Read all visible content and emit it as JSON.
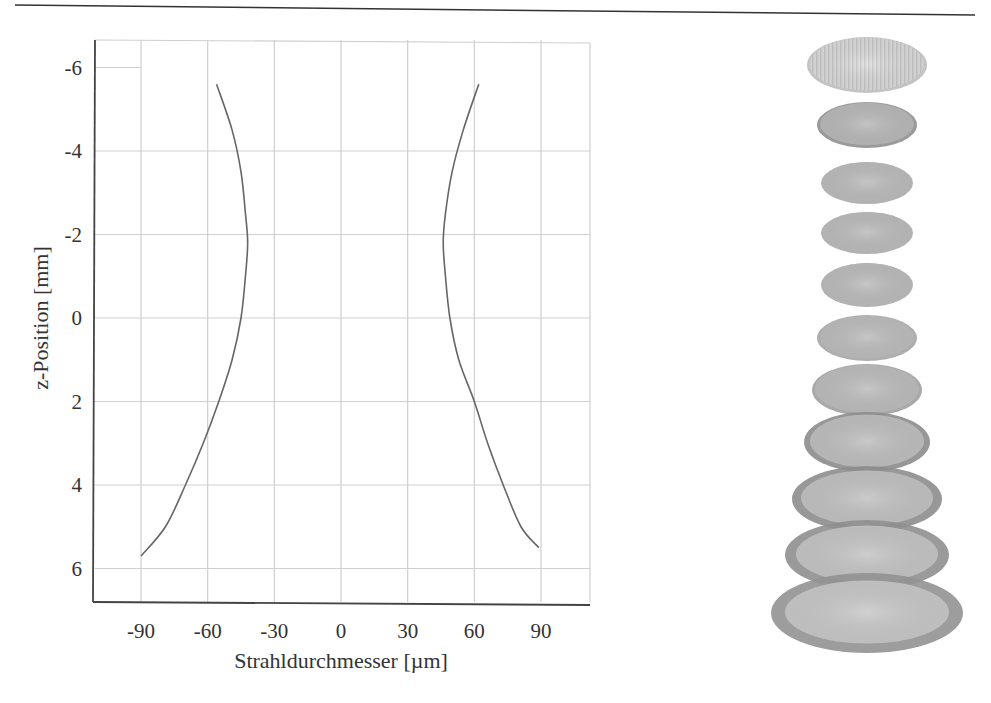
{
  "page": {
    "header_rule": true
  },
  "chart_data": {
    "type": "line",
    "title": "",
    "xlabel": "Strahldurchmesser [µm]",
    "ylabel": "z-Position [mm]",
    "xlim": [
      -110,
      112
    ],
    "ylim": [
      6.8,
      -6.5
    ],
    "y_inverted": true,
    "grid": true,
    "x_ticks": [
      -90,
      -60,
      -30,
      0,
      30,
      60,
      90
    ],
    "y_ticks": [
      -6,
      -4,
      -2,
      0,
      2,
      4,
      6
    ],
    "x_tick_labels": [
      "-90",
      "-60",
      "-30",
      "0",
      "30",
      "60",
      "90"
    ],
    "y_tick_labels": [
      "-6",
      "-4",
      "-2",
      "0",
      "2",
      "4",
      "6"
    ],
    "series": [
      {
        "name": "left-beam-edge",
        "color": "#666666",
        "points": [
          [
            -56,
            -5.6
          ],
          [
            -49,
            -4.5
          ],
          [
            -45,
            -3.5
          ],
          [
            -43,
            -2.5
          ],
          [
            -42,
            -1.8
          ],
          [
            -43,
            -1.0
          ],
          [
            -45,
            0.0
          ],
          [
            -49,
            1.0
          ],
          [
            -55,
            2.0
          ],
          [
            -62,
            3.0
          ],
          [
            -70,
            4.0
          ],
          [
            -79,
            5.0
          ],
          [
            -90,
            5.7
          ]
        ]
      },
      {
        "name": "right-beam-edge",
        "color": "#666666",
        "points": [
          [
            62,
            -5.6
          ],
          [
            55,
            -4.5
          ],
          [
            50,
            -3.5
          ],
          [
            47,
            -2.5
          ],
          [
            46,
            -1.8
          ],
          [
            47,
            -1.0
          ],
          [
            49,
            0.0
          ],
          [
            53,
            1.0
          ],
          [
            60,
            2.0
          ],
          [
            66,
            3.0
          ],
          [
            73,
            4.0
          ],
          [
            81,
            5.0
          ],
          [
            89,
            5.5
          ]
        ]
      }
    ],
    "legend": null
  },
  "beam_profiles": {
    "count": 11,
    "items": [
      {
        "cx": 127,
        "cy": 30,
        "rx": 60,
        "ry": 28,
        "ring": 3,
        "fill": "#d6d6d6",
        "ring_color": "#bdbdbd",
        "style": "striped"
      },
      {
        "cx": 127,
        "cy": 90,
        "rx": 50,
        "ry": 23,
        "ring": 3,
        "fill": "#b9b9b9",
        "ring_color": "#8f8f8f"
      },
      {
        "cx": 127,
        "cy": 148,
        "rx": 46,
        "ry": 21,
        "ring": 2,
        "fill": "#bcbcbc",
        "ring_color": "#aaaaaa"
      },
      {
        "cx": 127,
        "cy": 198,
        "rx": 46,
        "ry": 21,
        "ring": 2,
        "fill": "#bcbcbc",
        "ring_color": "#aaaaaa"
      },
      {
        "cx": 127,
        "cy": 250,
        "rx": 46,
        "ry": 22,
        "ring": 2,
        "fill": "#bcbcbc",
        "ring_color": "#aaaaaa"
      },
      {
        "cx": 127,
        "cy": 303,
        "rx": 50,
        "ry": 23,
        "ring": 3,
        "fill": "#bdbdbd",
        "ring_color": "#a5a5a5"
      },
      {
        "cx": 127,
        "cy": 355,
        "rx": 55,
        "ry": 26,
        "ring": 3,
        "fill": "#bdbdbd",
        "ring_color": "#a0a0a0"
      },
      {
        "cx": 127,
        "cy": 407,
        "rx": 63,
        "ry": 30,
        "ring": 6,
        "fill": "#bfbfbf",
        "ring_color": "#8c8c8c"
      },
      {
        "cx": 127,
        "cy": 464,
        "rx": 75,
        "ry": 33,
        "ring": 9,
        "fill": "#c2c2c2",
        "ring_color": "#8d8d8d"
      },
      {
        "cx": 127,
        "cy": 520,
        "rx": 82,
        "ry": 35,
        "ring": 11,
        "fill": "#c5c5c5",
        "ring_color": "#8f8f8f"
      },
      {
        "cx": 127,
        "cy": 578,
        "rx": 96,
        "ry": 40,
        "ring": 14,
        "fill": "#c8c8c8",
        "ring_color": "#929292"
      }
    ]
  }
}
